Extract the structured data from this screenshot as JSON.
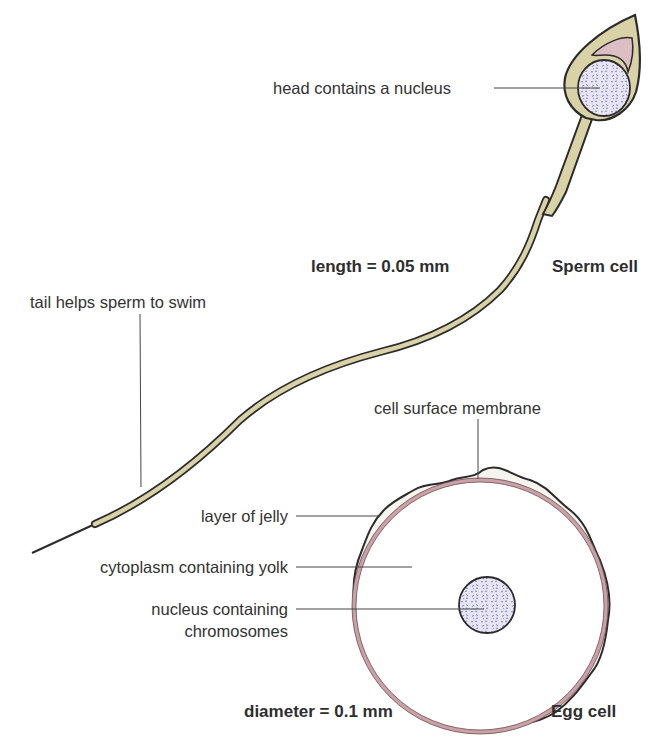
{
  "figure": {
    "sperm": {
      "title": "Sperm cell",
      "measurement": "length = 0.05 mm",
      "labels": {
        "head": "head contains a nucleus",
        "tail": "tail helps sperm to swim"
      }
    },
    "egg": {
      "title": "Egg cell",
      "measurement": "diameter = 0.1 mm",
      "labels": {
        "membrane": "cell surface membrane",
        "jelly": "layer of jelly",
        "cytoplasm": "cytoplasm containing yolk",
        "nucleus_line1": "nucleus containing",
        "nucleus_line2": "chromosomes"
      }
    },
    "colors": {
      "sperm_body": "#d9d2a6",
      "outline": "#2b2b2b",
      "acrosome": "#dcbfc4",
      "nucleus_fill": "#e6e4f2",
      "nucleus_speckle": "#7a74b8",
      "jelly": "#f6f4ee",
      "membrane": "#c9a1a6"
    }
  }
}
